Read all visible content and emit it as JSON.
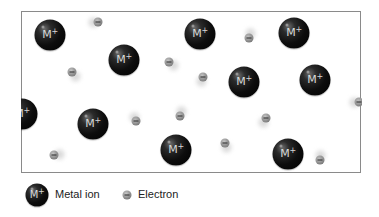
{
  "diagram": {
    "title": "",
    "ion_label": "M",
    "ion_charge": "+",
    "colors": {
      "ion": "#000000",
      "ion_label": "#d8d8d8",
      "electron": "#8d8d8d",
      "frame_border": "#8a8a8a"
    },
    "ions": [
      {
        "x": 50,
        "y": 35
      },
      {
        "x": 124,
        "y": 60
      },
      {
        "x": 200,
        "y": 34
      },
      {
        "x": 294,
        "y": 33
      },
      {
        "x": 244,
        "y": 82
      },
      {
        "x": 315,
        "y": 80
      },
      {
        "x": 22,
        "y": 114
      },
      {
        "x": 93,
        "y": 124
      },
      {
        "x": 176,
        "y": 150
      },
      {
        "x": 288,
        "y": 154
      }
    ],
    "electrons": [
      {
        "x": 98,
        "y": 22,
        "tx": -5,
        "ty": 0
      },
      {
        "x": 72,
        "y": 72,
        "tx": 3,
        "ty": 4
      },
      {
        "x": 169,
        "y": 62,
        "tx": 4,
        "ty": 3
      },
      {
        "x": 203,
        "y": 77,
        "tx": -2,
        "ty": 4
      },
      {
        "x": 249,
        "y": 38,
        "tx": 1,
        "ty": -5
      },
      {
        "x": 359,
        "y": 102,
        "tx": -5,
        "ty": 0
      },
      {
        "x": 54,
        "y": 155,
        "tx": 5,
        "ty": -1
      },
      {
        "x": 136,
        "y": 121,
        "tx": -2,
        "ty": -4
      },
      {
        "x": 180,
        "y": 116,
        "tx": 1,
        "ty": -5
      },
      {
        "x": 225,
        "y": 143,
        "tx": 1,
        "ty": 4
      },
      {
        "x": 266,
        "y": 118,
        "tx": -3,
        "ty": 4
      },
      {
        "x": 320,
        "y": 160,
        "tx": 0,
        "ty": -5
      }
    ]
  },
  "legend": {
    "metal_ion_label": "Metal ion",
    "electron_label": "Electron",
    "ion_symbol": "M",
    "ion_charge": "+"
  }
}
